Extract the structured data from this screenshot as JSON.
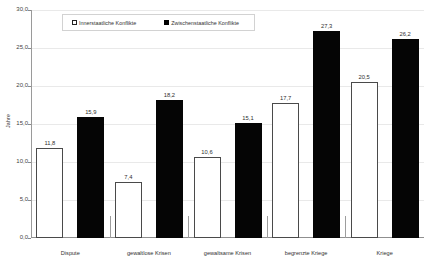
{
  "chart_data": {
    "type": "bar",
    "title": "",
    "xlabel": "",
    "ylabel": "Jahre",
    "ylim": [
      0.0,
      30.0
    ],
    "ytick_step": 5.0,
    "grid": true,
    "legend_position": "top-center",
    "categories": [
      "Dispute",
      "gewaltlose Krisen",
      "gewaltsame Krisen",
      "begrenzte Kriege",
      "Kriege"
    ],
    "series": [
      {
        "name": "Innerstaatliche Konflikte",
        "style": "open",
        "values": [
          11.8,
          7.4,
          10.6,
          17.7,
          20.5
        ],
        "labels": [
          "11,8",
          "7,4",
          "10,6",
          "17,7",
          "20,5"
        ]
      },
      {
        "name": "Zwischenstaatliche Konflikte",
        "style": "solid",
        "values": [
          15.9,
          18.2,
          15.1,
          27.3,
          26.2
        ],
        "labels": [
          "15,9",
          "18,2",
          "15,1",
          "27,3",
          "26,2"
        ]
      }
    ],
    "ytick_labels": [
      "0,0",
      "5,0",
      "10,0",
      "15,0",
      "20,0",
      "25,0",
      "30,0"
    ],
    "ytick_values": [
      0.0,
      5.0,
      10.0,
      15.0,
      20.0,
      25.0,
      30.0
    ],
    "colors": {
      "series_open_fill": "#ffffff",
      "series_open_edge": "#4a4a4a",
      "series_solid_fill": "#050505",
      "grid": "#e9e9e9",
      "axis": "#8f8f8f",
      "text": "#2f2f2f"
    }
  }
}
